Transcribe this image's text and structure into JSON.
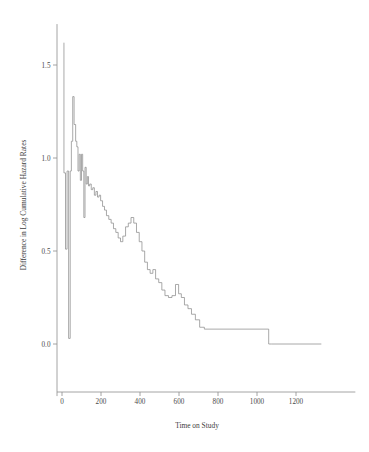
{
  "chart_data": {
    "type": "line",
    "title": "",
    "xlabel": "Time on Study",
    "ylabel": "Difference in Log Cumulative Hazard Rates",
    "xlim": [
      -20,
      1330
    ],
    "ylim": [
      -0.28,
      1.72
    ],
    "xticks": [
      0,
      200,
      400,
      600,
      800,
      1000,
      1200
    ],
    "xtick_labels": [
      "0",
      "200",
      "400",
      "600",
      "800",
      "1000",
      "1200"
    ],
    "yticks": [
      0.0,
      0.5,
      1.0,
      1.5
    ],
    "ytick_labels": [
      "0.0",
      "0.5",
      "1.0",
      "1.5"
    ],
    "grid": false,
    "legend": null,
    "line_color": "#8c8c8c",
    "step_style": "post",
    "series": [
      {
        "name": "Difference in Log Cumulative Hazard Rates",
        "x": [
          10,
          10,
          18,
          18,
          26,
          26,
          34,
          34,
          42,
          42,
          48,
          48,
          55,
          55,
          62,
          62,
          70,
          70,
          76,
          76,
          82,
          82,
          88,
          88,
          94,
          94,
          100,
          100,
          106,
          106,
          112,
          112,
          118,
          118,
          124,
          124,
          130,
          130,
          136,
          136,
          142,
          142,
          150,
          150,
          158,
          158,
          166,
          166,
          174,
          174,
          182,
          182,
          190,
          190,
          198,
          198,
          208,
          208,
          218,
          218,
          228,
          228,
          240,
          240,
          252,
          252,
          264,
          264,
          276,
          276,
          288,
          288,
          300,
          300,
          312,
          312,
          326,
          326,
          340,
          340,
          354,
          354,
          368,
          368,
          382,
          382,
          396,
          396,
          410,
          410,
          424,
          424,
          438,
          438,
          452,
          452,
          466,
          466,
          480,
          480,
          496,
          496,
          512,
          512,
          528,
          528,
          546,
          546,
          564,
          564,
          582,
          582,
          598,
          598,
          612,
          612,
          628,
          628,
          646,
          646,
          664,
          664,
          684,
          684,
          706,
          706,
          730,
          730,
          1060,
          1060,
          1075,
          1075,
          1330
        ],
        "y": [
          1.62,
          0.92,
          0.92,
          0.51,
          0.51,
          0.93,
          0.93,
          0.03,
          0.03,
          0.93,
          0.93,
          1.09,
          1.09,
          1.33,
          1.33,
          1.18,
          1.18,
          1.09,
          1.09,
          1.06,
          1.06,
          0.93,
          0.93,
          1.02,
          1.02,
          0.88,
          0.88,
          1.02,
          1.02,
          0.93,
          0.93,
          0.68,
          0.68,
          0.95,
          0.95,
          0.86,
          0.86,
          0.9,
          0.9,
          0.85,
          0.85,
          0.86,
          0.86,
          0.83,
          0.83,
          0.84,
          0.84,
          0.8,
          0.8,
          0.82,
          0.82,
          0.79,
          0.79,
          0.8,
          0.8,
          0.77,
          0.77,
          0.74,
          0.74,
          0.72,
          0.72,
          0.69,
          0.69,
          0.67,
          0.67,
          0.65,
          0.65,
          0.62,
          0.62,
          0.6,
          0.6,
          0.57,
          0.57,
          0.55,
          0.55,
          0.58,
          0.58,
          0.63,
          0.63,
          0.65,
          0.65,
          0.68,
          0.68,
          0.65,
          0.65,
          0.6,
          0.6,
          0.55,
          0.55,
          0.5,
          0.5,
          0.44,
          0.44,
          0.4,
          0.4,
          0.38,
          0.38,
          0.4,
          0.4,
          0.35,
          0.35,
          0.33,
          0.33,
          0.29,
          0.29,
          0.26,
          0.26,
          0.25,
          0.25,
          0.26,
          0.26,
          0.32,
          0.32,
          0.27,
          0.27,
          0.25,
          0.25,
          0.21,
          0.21,
          0.19,
          0.19,
          0.16,
          0.16,
          0.13,
          0.13,
          0.09,
          0.09,
          0.08,
          0.08,
          0.0,
          0.0,
          0.0,
          0.0
        ]
      }
    ]
  }
}
